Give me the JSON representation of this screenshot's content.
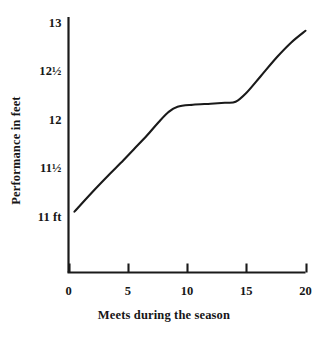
{
  "chart_data": {
    "type": "line",
    "title": "",
    "xlabel": "Meets during the season",
    "ylabel": "Performance in feet",
    "xlim": [
      0,
      20
    ],
    "ylim": [
      11,
      13
    ],
    "grid": false,
    "legend": false,
    "x_ticks": [
      {
        "value": 0,
        "label": "0"
      },
      {
        "value": 5,
        "label": "5"
      },
      {
        "value": 10,
        "label": "10"
      },
      {
        "value": 15,
        "label": "15"
      },
      {
        "value": 20,
        "label": "20"
      }
    ],
    "y_ticks": [
      {
        "value": 11,
        "label": "11 ft"
      },
      {
        "value": 11.5,
        "label": "11½"
      },
      {
        "value": 12,
        "label": "12"
      },
      {
        "value": 12.5,
        "label": "12½"
      },
      {
        "value": 13,
        "label": "13"
      }
    ],
    "series": [
      {
        "name": "Performance",
        "color": "#1a1a1a",
        "x": [
          0.5,
          2.0,
          3.5,
          4.4,
          5.5,
          6.6,
          7.6,
          8.4,
          9.2,
          10.5,
          12.0,
          13.2,
          14.1,
          15.0,
          16.2,
          17.6,
          18.8,
          20.0
        ],
        "y": [
          11.06,
          11.26,
          11.45,
          11.56,
          11.7,
          11.84,
          11.98,
          12.08,
          12.14,
          12.16,
          12.17,
          12.18,
          12.19,
          12.28,
          12.45,
          12.65,
          12.8,
          12.92
        ]
      }
    ]
  },
  "axis": {
    "y_axis_name": "y-axis-line",
    "x_axis_name": "x-axis-line"
  }
}
